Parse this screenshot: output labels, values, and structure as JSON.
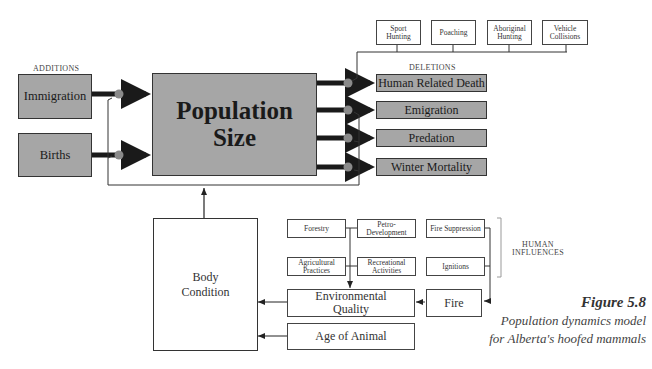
{
  "additions": {
    "label": "ADDITIONS",
    "items": [
      "Immigration",
      "Births"
    ]
  },
  "population": {
    "line1": "Population",
    "line2": "Size"
  },
  "deletions": {
    "label": "DELETIONS",
    "items": [
      "Human Related Death",
      "Emigration",
      "Predation",
      "Winter Mortality"
    ]
  },
  "human_death_causes": [
    {
      "line1": "Sport",
      "line2": "Hunting"
    },
    {
      "line1": "Poaching",
      "line2": ""
    },
    {
      "line1": "Aboriginal",
      "line2": "Hunting"
    },
    {
      "line1": "Vehicle",
      "line2": "Collisions"
    }
  ],
  "body_condition": {
    "line1": "Body",
    "line2": "Condition"
  },
  "human_influences": {
    "label_line1": "HUMAN",
    "label_line2": "INFLUENCES",
    "forestry": "Forestry",
    "petro": {
      "line1": "Petro-",
      "line2": "Development"
    },
    "agricultural": {
      "line1": "Agricultural",
      "line2": "Practices"
    },
    "recreational": {
      "line1": "Recreational",
      "line2": "Activities"
    },
    "fire_suppression": "Fire Suppression",
    "ignitions": "Ignitions"
  },
  "environmental_quality": {
    "line1": "Environmental",
    "line2": "Quality"
  },
  "fire": "Fire",
  "age_of_animal": "Age of Animal",
  "caption": {
    "title": "Figure 5.8",
    "line1": "Population dynamics model",
    "line2": "for Alberta's hoofed mammals"
  },
  "colors": {
    "box_fill": "#a6a6a6",
    "arrow": "#1a1a1a",
    "junction": "#8a8a8a"
  }
}
